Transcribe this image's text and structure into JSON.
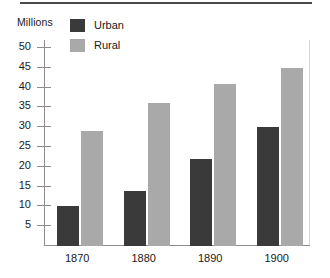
{
  "chart_data": {
    "type": "bar",
    "title": "",
    "subtitle": "",
    "xlabel": "",
    "ylabel": "Millions",
    "categories": [
      "1870",
      "1880",
      "1890",
      "1900"
    ],
    "series": [
      {
        "name": "Urban",
        "values": [
          10,
          14,
          22,
          30
        ],
        "color": "#3a3a3a"
      },
      {
        "name": "Rural",
        "values": [
          29,
          36,
          41,
          45
        ],
        "color": "#a9a9a9"
      }
    ],
    "ylim": [
      0,
      52
    ],
    "yticks": [
      5,
      10,
      15,
      20,
      25,
      30,
      35,
      40,
      45,
      50
    ],
    "ytick_labels": [
      "5",
      "10",
      "15",
      "20",
      "25",
      "30",
      "35",
      "40",
      "45",
      "50"
    ],
    "grid": false,
    "legend_position": "top-center"
  },
  "legend": {
    "items": [
      {
        "label": "Urban",
        "color": "#3a3a3a"
      },
      {
        "label": "Rural",
        "color": "#a9a9a9"
      }
    ]
  },
  "axes": {
    "y_title": "Millions"
  }
}
